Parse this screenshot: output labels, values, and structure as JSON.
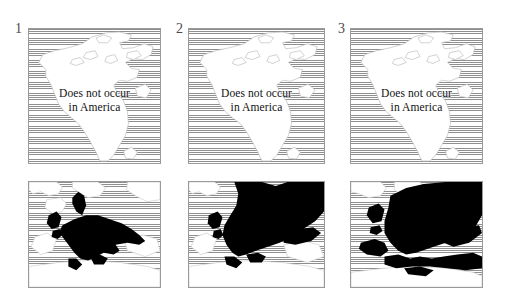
{
  "figure": {
    "kind": "distribution-maps",
    "columns": 3,
    "rows": 2,
    "background_color": "#ffffff",
    "ocean_hatch_color": "#8f8f8f",
    "land_color": "#ffffff",
    "distribution_color": "#000000",
    "border_color": "#9a9a9a"
  },
  "panels": [
    {
      "label": "1",
      "top": {
        "region": "North America",
        "caption_line1": "Does not occur",
        "caption_line2": "in America",
        "has_distribution": false
      },
      "bottom": {
        "region": "Europe",
        "has_distribution": true,
        "extent": "western and central Europe"
      }
    },
    {
      "label": "2",
      "top": {
        "region": "North America",
        "caption_line1": "Does not occur",
        "caption_line2": "in America",
        "has_distribution": false
      },
      "bottom": {
        "region": "Europe",
        "has_distribution": true,
        "extent": "western, central, northern and eastern Europe"
      }
    },
    {
      "label": "3",
      "top": {
        "region": "North America",
        "caption_line1": "Does not occur",
        "caption_line2": "in America",
        "has_distribution": false
      },
      "bottom": {
        "region": "Europe",
        "has_distribution": true,
        "extent": "all of Europe including Mediterranean and North Africa"
      }
    }
  ]
}
